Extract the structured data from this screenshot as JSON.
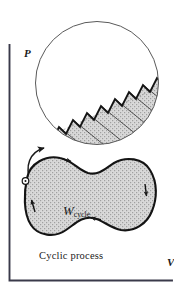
{
  "figure": {
    "kind": "pv-diagram-cyclic-process",
    "axes": {
      "y_label": "P",
      "x_label": "V"
    },
    "caption": "Cyclic process",
    "work_label": {
      "symbol": "W",
      "subscript": "cycle"
    },
    "colors": {
      "ink": "#1a1a1a",
      "axis": "#2b2b3a",
      "stipple_fill": "#cfcfcf",
      "stipple_dot": "#8a8a8a",
      "circle_outline": "#555555",
      "background": "#ffffff"
    },
    "magnifier": {
      "name": "magnified-detail-circle",
      "center_x": 97,
      "center_y": 83,
      "radius": 62,
      "content": "sawtooth-staircase-with-vertical-strips",
      "teeth_count": 8
    },
    "cycle_loop": {
      "name": "cyclic-process-blob",
      "shape": "peanut",
      "start_marker": "state-point-circle",
      "direction": "clockwise",
      "arrowhead_count": 4
    },
    "callout_arrow": {
      "name": "magnifier-callout-arrow",
      "from": "blob-upper-left",
      "to": "magnifier-bottom-left"
    }
  }
}
